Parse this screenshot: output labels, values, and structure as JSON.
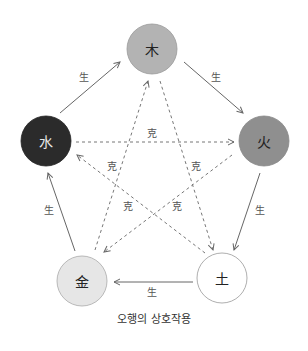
{
  "caption": "오행의 상호작용",
  "colors": {
    "wood": "#b3b3b3",
    "fire": "#8f8f8f",
    "earth": "#ffffff",
    "metal": "#e6e6e6",
    "water": "#2b2b2b",
    "line": "#666666"
  },
  "nodes": {
    "wood": "木",
    "fire": "火",
    "earth": "土",
    "metal": "金",
    "water": "水"
  },
  "edges": {
    "generate_label": "生",
    "overcome_label": "克"
  }
}
